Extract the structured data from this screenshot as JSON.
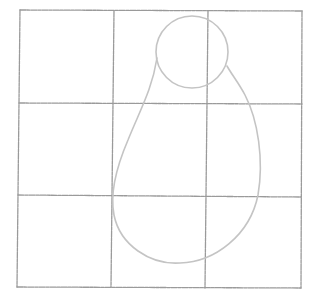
{
  "drawing": {
    "description": "Pencil sketch of a 3x3 grid with a pear-shaped outline (small circle on top of a teardrop body)",
    "colors": {
      "background": "#ffffff",
      "grid": "#9a9a9a",
      "shape": "#c4c4c4"
    },
    "grid": {
      "columns": 3,
      "rows": 3,
      "x_lines": [
        20,
        113,
        207,
        302
      ],
      "y_lines": [
        10,
        103,
        196,
        287
      ]
    },
    "shapes": [
      {
        "name": "head-circle",
        "cx": 192,
        "cy": 52,
        "r": 36
      },
      {
        "name": "body-teardrop",
        "top_left": [
          160,
          50
        ],
        "top_right": [
          227,
          72
        ],
        "bottom": [
          180,
          263
        ],
        "left_extent": 112,
        "right_extent": 260
      }
    ]
  }
}
